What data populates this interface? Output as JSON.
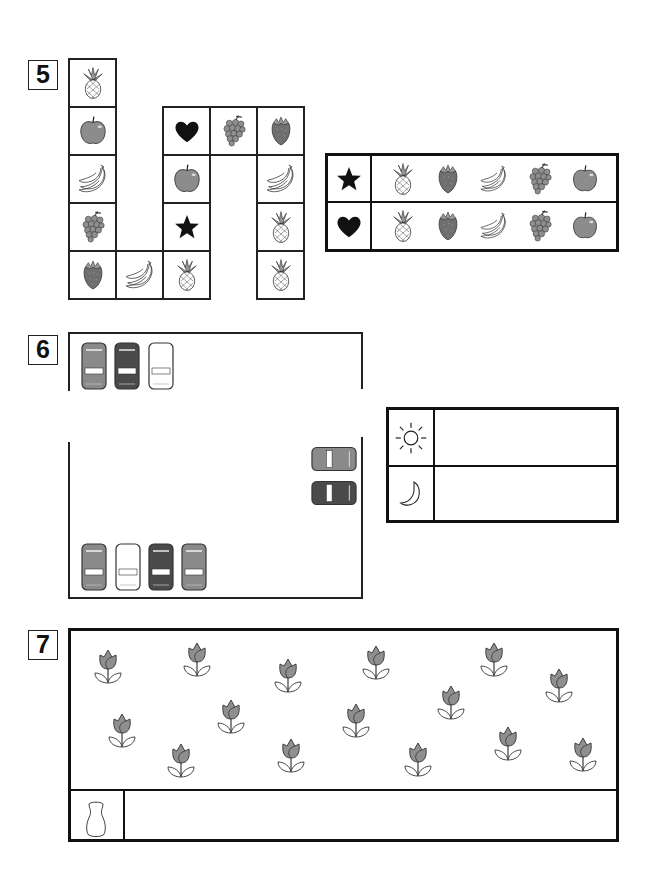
{
  "sections": [
    {
      "number": "5",
      "type": "path-grid",
      "grid_cells": [
        {
          "col": 0,
          "row": 0,
          "item": "pineapple"
        },
        {
          "col": 0,
          "row": 1,
          "item": "apple"
        },
        {
          "col": 0,
          "row": 2,
          "item": "banana"
        },
        {
          "col": 0,
          "row": 3,
          "item": "grapes"
        },
        {
          "col": 0,
          "row": 4,
          "item": "strawberry"
        },
        {
          "col": 1,
          "row": 4,
          "item": "banana"
        },
        {
          "col": 2,
          "row": 4,
          "item": "pineapple"
        },
        {
          "col": 2,
          "row": 3,
          "item": "star"
        },
        {
          "col": 2,
          "row": 2,
          "item": "apple"
        },
        {
          "col": 2,
          "row": 1,
          "item": "heart"
        },
        {
          "col": 3,
          "row": 1,
          "item": "grapes"
        },
        {
          "col": 4,
          "row": 1,
          "item": "strawberry"
        },
        {
          "col": 4,
          "row": 2,
          "item": "banana"
        },
        {
          "col": 4,
          "row": 3,
          "item": "pineapple"
        },
        {
          "col": 4,
          "row": 4,
          "item": "pineapple"
        }
      ],
      "legend": [
        {
          "key": "star",
          "items": [
            "pineapple",
            "strawberry",
            "banana",
            "grapes",
            "apple"
          ]
        },
        {
          "key": "heart",
          "items": [
            "pineapple",
            "strawberry",
            "banana",
            "grapes",
            "apple"
          ]
        }
      ]
    },
    {
      "number": "6",
      "type": "parking-lot",
      "top_row_cars": [
        "gray",
        "dark",
        "white"
      ],
      "side_cars": [
        "gray",
        "dark"
      ],
      "bottom_row_cars": [
        "gray",
        "white",
        "dark",
        "gray"
      ],
      "table": [
        {
          "key": "sun",
          "value": ""
        },
        {
          "key": "moon",
          "value": ""
        }
      ]
    },
    {
      "number": "7",
      "type": "tulip-field",
      "tulip_count": 16,
      "answer_row": {
        "key": "vase",
        "value": ""
      }
    }
  ],
  "colors": {
    "line": "#111111",
    "car_gray": "#8a8a8a",
    "car_dark": "#4a4a4a",
    "car_white": "#ffffff",
    "tulip": "#8f8f8f",
    "apple": "#8c8c8c",
    "strawberry": "#707070"
  }
}
